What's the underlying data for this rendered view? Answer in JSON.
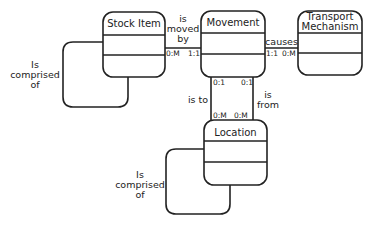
{
  "diagram": {
    "type": "entity-relationship",
    "entities": [
      {
        "id": "stock_item",
        "name": "Stock Item"
      },
      {
        "id": "movement",
        "name": "Movement"
      },
      {
        "id": "transport",
        "name": "Transport Mechanism",
        "name_lines": [
          "Transport",
          "Mechanism"
        ]
      },
      {
        "id": "location",
        "name": "Location"
      }
    ],
    "relationships": [
      {
        "id": "stock_self",
        "from": "stock_item",
        "to": "stock_item",
        "label_lines": [
          "Is",
          "comprised",
          "of"
        ]
      },
      {
        "id": "stock_movement",
        "from": "stock_item",
        "to": "movement",
        "label_lines": [
          "is",
          "moved",
          "by"
        ],
        "card_from": "0:M",
        "card_to": "1:1"
      },
      {
        "id": "movement_transport",
        "from": "movement",
        "to": "transport",
        "label": "causes",
        "card_from": "1:1",
        "card_to": "0:M"
      },
      {
        "id": "movement_location_to",
        "from": "movement",
        "to": "location",
        "label": "is to",
        "card_from": "0:1",
        "card_to": "0:M"
      },
      {
        "id": "movement_location_from",
        "from": "movement",
        "to": "location",
        "label_lines": [
          "is",
          "from"
        ],
        "card_from": "0:1",
        "card_to": "0:M"
      },
      {
        "id": "location_self",
        "from": "location",
        "to": "location",
        "label_lines": [
          "Is",
          "comprised",
          "of"
        ]
      }
    ]
  }
}
